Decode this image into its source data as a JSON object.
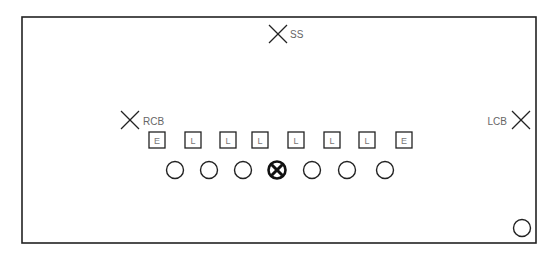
{
  "diagram": {
    "title": "",
    "colors": {
      "line": "#222222",
      "label": "#666666",
      "background": "#ffffff"
    },
    "field_frame": {
      "x": 22,
      "y": 17,
      "width": 514,
      "height": 226
    },
    "defenders": [
      {
        "label": "SS",
        "x": 278,
        "y": 34,
        "label_x": 290,
        "label_y": 38,
        "anchor": "start"
      },
      {
        "label": "RCB",
        "x": 130,
        "y": 120,
        "label_x": 143,
        "label_y": 125,
        "anchor": "start"
      },
      {
        "label": "LCB",
        "x": 521,
        "y": 120,
        "label_x": 507,
        "label_y": 125,
        "anchor": "end"
      }
    ],
    "front_line": [
      {
        "label": "E",
        "x": 157
      },
      {
        "label": "L",
        "x": 193
      },
      {
        "label": "L",
        "x": 228
      },
      {
        "label": "L",
        "x": 260
      },
      {
        "label": "L",
        "x": 296
      },
      {
        "label": "L",
        "x": 332
      },
      {
        "label": "L",
        "x": 367
      },
      {
        "label": "E",
        "x": 404
      }
    ],
    "front_line_y": 140,
    "offense": [
      {
        "type": "circle",
        "x": 175
      },
      {
        "type": "circle",
        "x": 209
      },
      {
        "type": "circle",
        "x": 243
      },
      {
        "type": "center",
        "x": 277
      },
      {
        "type": "circle",
        "x": 312
      },
      {
        "type": "circle",
        "x": 347
      },
      {
        "type": "circle",
        "x": 385
      }
    ],
    "offense_y": 170,
    "extra_player": {
      "type": "circle",
      "x": 522,
      "y": 228
    }
  }
}
